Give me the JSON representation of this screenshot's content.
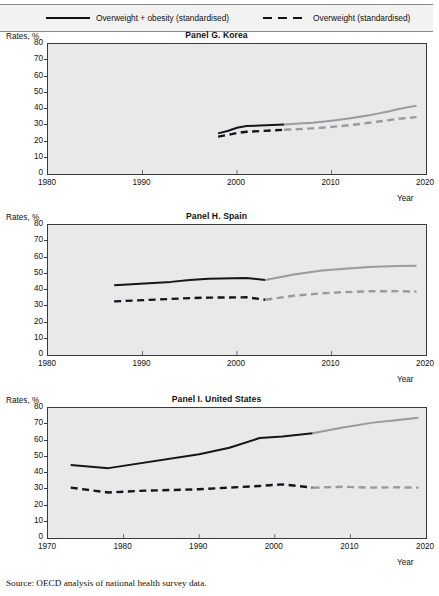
{
  "legend": {
    "items": [
      {
        "label": "Overweight + obesity (standardised)",
        "style": "solid",
        "color": "#111111"
      },
      {
        "label": "Overweight (standardised)",
        "style": "dashed",
        "color": "#111111"
      }
    ]
  },
  "axis_labels": {
    "y_title": "Rates, %",
    "x_title": "Year"
  },
  "source": "Source:  OECD analysis of national health survey data.",
  "chart_data": [
    {
      "type": "line",
      "title": "Panel G. Korea",
      "xlabel": "Year",
      "ylabel": "Rates, %",
      "ylim": [
        0,
        80
      ],
      "xlim": [
        1980,
        2020
      ],
      "yticks": [
        0,
        10,
        20,
        30,
        40,
        50,
        60,
        70,
        80
      ],
      "xticks": [
        1980,
        1990,
        2000,
        2010,
        2020
      ],
      "grid": false,
      "legend_position": "top",
      "break_year": 2005,
      "series": [
        {
          "name": "Overweight + obesity (standardised)",
          "style": "solid",
          "x": [
            1998,
            1999,
            2000,
            2001,
            2005,
            2007,
            2008,
            2009,
            2010,
            2011,
            2012,
            2013,
            2014,
            2015,
            2016,
            2017,
            2018,
            2019
          ],
          "values": [
            25.0,
            26.5,
            28.5,
            29.5,
            30.5,
            31.2,
            31.6,
            32.2,
            32.8,
            33.5,
            34.3,
            35.2,
            36.2,
            37.3,
            38.5,
            39.8,
            41.0,
            42.0
          ]
        },
        {
          "name": "Overweight (standardised)",
          "style": "dashed",
          "x": [
            1998,
            1999,
            2000,
            2001,
            2005,
            2007,
            2008,
            2009,
            2010,
            2011,
            2012,
            2013,
            2014,
            2015,
            2016,
            2017,
            2018,
            2019
          ],
          "values": [
            23.0,
            24.0,
            25.2,
            26.0,
            27.2,
            27.8,
            28.1,
            28.5,
            29.0,
            29.5,
            30.1,
            30.8,
            31.5,
            32.3,
            33.1,
            33.9,
            34.5,
            35.0
          ]
        }
      ]
    },
    {
      "type": "line",
      "title": "Panel H. Spain",
      "xlabel": "Year",
      "ylabel": "Rates, %",
      "ylim": [
        0,
        80
      ],
      "xlim": [
        1980,
        2020
      ],
      "yticks": [
        0,
        10,
        20,
        30,
        40,
        50,
        60,
        70,
        80
      ],
      "xticks": [
        1980,
        1990,
        2000,
        2010,
        2020
      ],
      "grid": false,
      "legend_position": "top",
      "break_year": 2003,
      "series": [
        {
          "name": "Overweight + obesity (standardised)",
          "style": "solid",
          "x": [
            1987,
            1993,
            1995,
            1997,
            2001,
            2003,
            2006,
            2009,
            2011,
            2014,
            2017,
            2019
          ],
          "values": [
            43.0,
            45.0,
            46.2,
            47.0,
            47.4,
            46.2,
            49.5,
            52.0,
            53.0,
            54.2,
            54.7,
            55.0
          ]
        },
        {
          "name": "Overweight (standardised)",
          "style": "dashed",
          "x": [
            1987,
            1993,
            1995,
            1997,
            2001,
            2003,
            2006,
            2009,
            2011,
            2014,
            2017,
            2019
          ],
          "values": [
            33.0,
            34.5,
            35.0,
            35.3,
            35.5,
            34.0,
            36.5,
            38.0,
            38.6,
            39.2,
            39.3,
            39.0
          ]
        }
      ]
    },
    {
      "type": "line",
      "title": "Panel I. United States",
      "xlabel": "Year",
      "ylabel": "Rates, %",
      "ylim": [
        0,
        80
      ],
      "xlim": [
        1970,
        2020
      ],
      "yticks": [
        0,
        10,
        20,
        30,
        40,
        50,
        60,
        70,
        80
      ],
      "xticks": [
        1970,
        1980,
        1990,
        2000,
        2010,
        2020
      ],
      "grid": false,
      "legend_position": "top",
      "break_year": 2005,
      "series": [
        {
          "name": "Overweight + obesity (standardised)",
          "style": "solid",
          "x": [
            1973,
            1978,
            1990,
            1994,
            1998,
            2001,
            2005,
            2009,
            2013,
            2016,
            2019
          ],
          "values": [
            45.0,
            43.0,
            51.5,
            55.5,
            61.5,
            62.5,
            64.5,
            68.0,
            71.0,
            72.5,
            74.0
          ]
        },
        {
          "name": "Overweight (standardised)",
          "style": "dashed",
          "x": [
            1973,
            1978,
            1982,
            1990,
            1994,
            1998,
            2001,
            2005,
            2009,
            2013,
            2016,
            2019
          ],
          "values": [
            31.0,
            28.0,
            29.0,
            30.0,
            31.0,
            32.0,
            33.0,
            31.0,
            31.5,
            31.0,
            31.2,
            31.0
          ]
        }
      ]
    }
  ]
}
